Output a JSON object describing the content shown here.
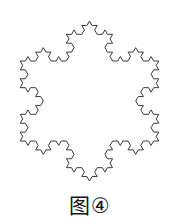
{
  "figure": {
    "caption_label": "图",
    "caption_number": "④",
    "caption_full": "图④",
    "shape_name": "koch-snowflake",
    "iteration": 3,
    "sides": 3,
    "stroke_color": "#3a3a3a",
    "background_color": "#ffffff",
    "stroke_width": 1
  },
  "chart_data": {
    "type": "line",
    "subtitle": "",
    "xlabel": "",
    "ylabel": "",
    "grid": false,
    "legend": "none",
    "xlim": [
      0,
      179
    ],
    "ylim": [
      0,
      188
    ],
    "series": [
      {
        "name": "koch-snowflake-outline",
        "iteration": 3,
        "base_polygon": "equilateral-triangle",
        "segment_count": 192,
        "closed": true,
        "center_x": 89.5,
        "center_y": 101,
        "circumradius": 80,
        "top_vertex": [
          89.5,
          12
        ],
        "bottom_left_vertex": [
          12.5,
          145.5
        ],
        "bottom_right_vertex": [
          166.5,
          145.5
        ],
        "stroke": "#3a3a3a"
      }
    ]
  }
}
